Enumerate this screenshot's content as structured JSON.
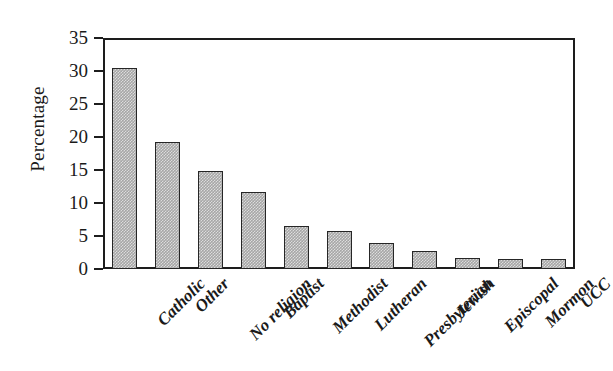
{
  "chart_data": {
    "type": "bar",
    "title": "",
    "subtitle": "",
    "xlabel": "",
    "ylabel": "Percentage",
    "ylim": [
      0,
      35
    ],
    "yticks": [
      0,
      5,
      10,
      15,
      20,
      25,
      30,
      35
    ],
    "ytick_labels": [
      "0",
      "5",
      "10",
      "15",
      "20",
      "25",
      "30",
      "35"
    ],
    "grid": false,
    "legend": false,
    "legend_position": "none",
    "orientation": "vertical",
    "bar_fill_color": "#a6a6a6",
    "bar_edge_color": "#262626",
    "axis_color": "#1d1d1d",
    "background_color": "#ffffff",
    "categories": [
      "Catholic",
      "Other",
      "No religion",
      "Baptist",
      "Methodist",
      "Lutheran",
      "Presbyterian",
      "Jewish",
      "Episcopal",
      "Mormon",
      "UCC"
    ],
    "values": [
      30.5,
      19.3,
      14.9,
      11.6,
      6.5,
      5.8,
      4.0,
      2.8,
      1.7,
      1.5,
      1.5
    ],
    "series": [
      {
        "name": "Percentage",
        "values": [
          30.5,
          19.3,
          14.9,
          11.6,
          6.5,
          5.8,
          4.0,
          2.8,
          1.7,
          1.5,
          1.5
        ]
      }
    ],
    "annotations": []
  },
  "axes": {
    "y_title": "Percentage"
  }
}
